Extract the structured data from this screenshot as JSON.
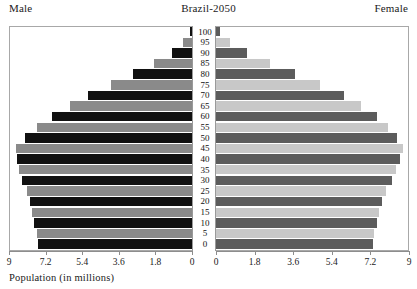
{
  "header": {
    "male_label": "Male",
    "title": "Brazil-2050",
    "female_label": "Female"
  },
  "axis": {
    "title": "Population (in millions)",
    "tick_labels_left": [
      "9",
      "7.2",
      "5.4",
      "3.6",
      "1.8",
      "0"
    ],
    "tick_labels_right": [
      "0",
      "1.8",
      "3.6",
      "5.4",
      "7.2",
      "9"
    ]
  },
  "chart_data": {
    "type": "bar",
    "subtype": "population-pyramid",
    "title": "Brazil-2050",
    "xlabel": "Population (in millions)",
    "ylabel": "",
    "xlim": [
      0,
      9
    ],
    "grid": false,
    "legend": "none",
    "categories": [
      "0",
      "5",
      "10",
      "15",
      "20",
      "25",
      "30",
      "35",
      "40",
      "45",
      "50",
      "55",
      "60",
      "65",
      "70",
      "75",
      "80",
      "85",
      "90",
      "95",
      "100"
    ],
    "series": [
      {
        "name": "Male",
        "side": "left",
        "color_odd": "#111111",
        "color_even": "#8a8a8a",
        "values": [
          7.55,
          7.6,
          7.75,
          7.85,
          7.95,
          8.1,
          8.35,
          8.5,
          8.6,
          8.65,
          8.2,
          7.6,
          6.9,
          6.0,
          5.1,
          4.0,
          2.9,
          1.85,
          1.0,
          0.42,
          0.12
        ]
      },
      {
        "name": "Female",
        "side": "right",
        "color_odd": "#5c5c5c",
        "color_even": "#c8c8c8",
        "values": [
          7.3,
          7.35,
          7.5,
          7.6,
          7.75,
          7.95,
          8.2,
          8.4,
          8.6,
          8.7,
          8.45,
          8.0,
          7.5,
          6.75,
          5.95,
          4.85,
          3.7,
          2.5,
          1.45,
          0.65,
          0.2
        ]
      }
    ]
  }
}
